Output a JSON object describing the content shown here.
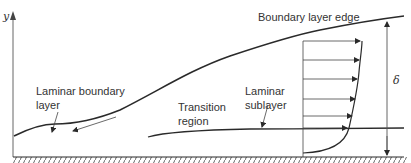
{
  "diagram": {
    "axis": {
      "y_label": "y"
    },
    "labels": {
      "edge": "Boundary layer edge",
      "laminar_line1": "Laminar boundary",
      "laminar_line2": "layer",
      "transition_line1": "Transition",
      "transition_line2": "region",
      "sublayer_line1": "Laminar",
      "sublayer_line2": "sublayer",
      "thickness": "δ"
    },
    "colors": {
      "line": "#2a2a2a",
      "text": "#333333",
      "hatch": "#555555"
    }
  }
}
